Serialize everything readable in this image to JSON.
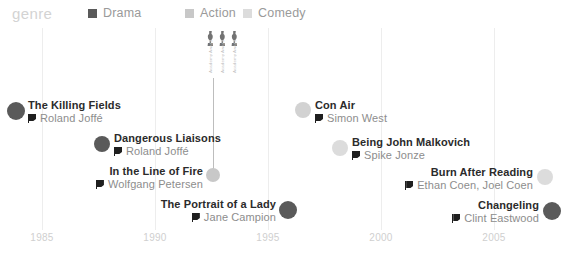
{
  "legend": {
    "title": "genre",
    "title_x": 12,
    "entries": [
      {
        "label": "Drama",
        "color": "#5a5a5a",
        "x": 88
      },
      {
        "label": "Action",
        "color": "#c8c8c8",
        "x": 185
      },
      {
        "label": "Comedy",
        "color": "#dcdcdc",
        "x": 243
      }
    ]
  },
  "axis": {
    "ticks": [
      {
        "label": "1985",
        "x": 42
      },
      {
        "label": "1990",
        "x": 155
      },
      {
        "label": "1995",
        "x": 268
      },
      {
        "label": "2000",
        "x": 381
      },
      {
        "label": "2005",
        "x": 494
      }
    ]
  },
  "awards": {
    "stem": {
      "x": 213,
      "top": 78,
      "height": 97
    },
    "icons_x": 206,
    "icons_y": 31,
    "items": [
      {
        "icon": "trophy-icon",
        "caption": "Academy Award"
      },
      {
        "icon": "trophy-icon",
        "caption": "Academy Award"
      },
      {
        "icon": "trophy-icon",
        "caption": "Academy Award"
      }
    ]
  },
  "films": [
    {
      "title": "The Killing Fields",
      "director": "Roland Joffé",
      "genre": "Drama",
      "color": "#5a5a5a",
      "dot_x": 16,
      "dot_y": 111,
      "dot_r": 9,
      "label_x": 28,
      "label_y": 99,
      "align": "left"
    },
    {
      "title": "Dangerous Liaisons",
      "director": "Roland Joffé",
      "genre": "Drama",
      "color": "#5a5a5a",
      "dot_x": 102,
      "dot_y": 144,
      "dot_r": 8,
      "label_x": 114,
      "label_y": 132,
      "align": "left"
    },
    {
      "title": "In the Line of Fire",
      "director": "Wolfgang Petersen",
      "genre": "Action",
      "color": "#c8c8c8",
      "dot_x": 213,
      "dot_y": 175,
      "dot_r": 7,
      "label_x": 203,
      "label_y": 165,
      "align": "right"
    },
    {
      "title": "The Portrait of a Lady",
      "director": "Jane Campion",
      "genre": "Drama",
      "color": "#5a5a5a",
      "dot_x": 288,
      "dot_y": 210,
      "dot_r": 9,
      "label_x": 276,
      "label_y": 198,
      "align": "right"
    },
    {
      "title": "Con Air",
      "director": "Simon West",
      "genre": "Action",
      "color": "#d2d2d2",
      "dot_x": 303,
      "dot_y": 110,
      "dot_r": 8,
      "label_x": 315,
      "label_y": 99,
      "align": "left"
    },
    {
      "title": "Being John Malkovich",
      "director": "Spike Jonze",
      "genre": "Comedy",
      "color": "#dcdcdc",
      "dot_x": 340,
      "dot_y": 148,
      "dot_r": 8,
      "label_x": 352,
      "label_y": 136,
      "align": "left"
    },
    {
      "title": "Burn After Reading",
      "director": "Ethan Coen, Joel Coen",
      "genre": "Comedy",
      "color": "#dcdcdc",
      "dot_x": 545,
      "dot_y": 177,
      "dot_r": 8,
      "label_x": 533,
      "label_y": 166,
      "align": "right"
    },
    {
      "title": "Changeling",
      "director": "Clint Eastwood",
      "genre": "Drama",
      "color": "#5a5a5a",
      "dot_x": 552,
      "dot_y": 211,
      "dot_r": 9,
      "label_x": 539,
      "label_y": 199,
      "align": "right"
    }
  ]
}
